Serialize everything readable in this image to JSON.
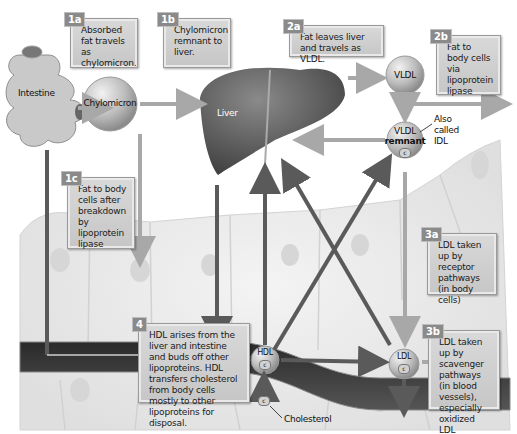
{
  "organs": {
    "intestine": "Intestine",
    "liver": "Liver"
  },
  "particles": {
    "chylomicron": "Chylomicron",
    "vldl": "VLDL",
    "vldl_remnant_line1": "VLDL",
    "vldl_remnant_line2": "remnant",
    "hdl_1": "HDL",
    "hdl_2": "HDL",
    "ldl": "LDL",
    "c_tag": "c"
  },
  "annotations": {
    "also_called_idl": "Also called IDL",
    "cholesterol": "Cholesterol"
  },
  "callouts": [
    {
      "id": "1a",
      "badge": "1a",
      "text": "Absorbed fat travels as chylomicron."
    },
    {
      "id": "1b",
      "badge": "1b",
      "text": "Chylomicron remnant to liver."
    },
    {
      "id": "1c",
      "badge": "1c",
      "text": "Fat to body cells after breakdown by lipoprotein lipase"
    },
    {
      "id": "2a",
      "badge": "2a",
      "text": "Fat leaves liver and travels as VLDL."
    },
    {
      "id": "2b",
      "badge": "2b",
      "text": "Fat to body cells via lipoprotein lipase"
    },
    {
      "id": "3a",
      "badge": "3a",
      "text": "LDL taken up by receptor pathways (in body cells)"
    },
    {
      "id": "3b",
      "badge": "3b",
      "text": "LDL taken up by scavenger pathways (in blood vessels), especially oxidized LDL"
    },
    {
      "id": "4",
      "badge": "4",
      "text": "HDL arises from the liver and intestine and buds off other lipoproteins. HDL transfers cholesterol from body cells mostly to other lipoproteins for disposal."
    }
  ],
  "colors": {
    "dark_arrow": "#5a5a5a",
    "light_arrow": "#a8a8a8",
    "vessel": "#3d3d3d",
    "callout_bg": "#d0d0d0",
    "badge_bg": "#8a8a8a"
  }
}
